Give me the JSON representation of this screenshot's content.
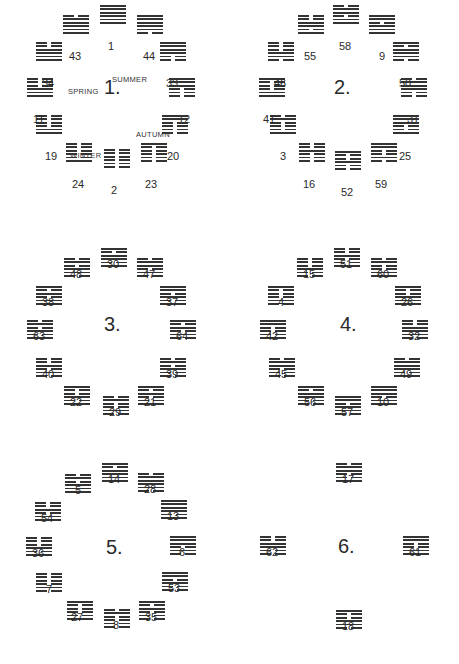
{
  "line_colors": {
    "ink": "#333333",
    "background": "#ffffff"
  },
  "trigram_bits_bottom_to_top": {
    "qian": [
      1,
      1,
      1
    ],
    "dui": [
      1,
      1,
      0
    ],
    "li": [
      1,
      0,
      1
    ],
    "zhen": [
      1,
      0,
      0
    ],
    "xun": [
      0,
      1,
      1
    ],
    "kan": [
      0,
      1,
      0
    ],
    "gen": [
      0,
      0,
      1
    ],
    "kun": [
      0,
      0,
      0
    ]
  },
  "hexagram_trigrams_lower_upper": {
    "1": [
      "qian",
      "qian"
    ],
    "2": [
      "kun",
      "kun"
    ],
    "3": [
      "zhen",
      "kan"
    ],
    "4": [
      "kan",
      "gen"
    ],
    "5": [
      "qian",
      "kan"
    ],
    "6": [
      "kan",
      "qian"
    ],
    "7": [
      "kan",
      "kun"
    ],
    "8": [
      "kun",
      "kan"
    ],
    "9": [
      "qian",
      "xun"
    ],
    "10": [
      "dui",
      "qian"
    ],
    "11": [
      "qian",
      "kun"
    ],
    "12": [
      "kun",
      "qian"
    ],
    "13": [
      "li",
      "qian"
    ],
    "14": [
      "qian",
      "li"
    ],
    "15": [
      "gen",
      "kun"
    ],
    "16": [
      "kun",
      "zhen"
    ],
    "17": [
      "zhen",
      "dui"
    ],
    "18": [
      "xun",
      "gen"
    ],
    "19": [
      "dui",
      "kun"
    ],
    "20": [
      "kun",
      "xun"
    ],
    "21": [
      "zhen",
      "li"
    ],
    "22": [
      "li",
      "gen"
    ],
    "23": [
      "kun",
      "gen"
    ],
    "24": [
      "zhen",
      "kun"
    ],
    "25": [
      "zhen",
      "qian"
    ],
    "26": [
      "qian",
      "gen"
    ],
    "27": [
      "zhen",
      "gen"
    ],
    "28": [
      "xun",
      "dui"
    ],
    "29": [
      "kan",
      "kan"
    ],
    "30": [
      "li",
      "li"
    ],
    "31": [
      "gen",
      "dui"
    ],
    "32": [
      "xun",
      "zhen"
    ],
    "33": [
      "gen",
      "qian"
    ],
    "34": [
      "qian",
      "zhen"
    ],
    "35": [
      "kun",
      "li"
    ],
    "36": [
      "li",
      "kun"
    ],
    "37": [
      "li",
      "xun"
    ],
    "38": [
      "dui",
      "li"
    ],
    "39": [
      "gen",
      "kan"
    ],
    "40": [
      "kan",
      "zhen"
    ],
    "41": [
      "dui",
      "gen"
    ],
    "42": [
      "zhen",
      "xun"
    ],
    "43": [
      "qian",
      "dui"
    ],
    "44": [
      "xun",
      "qian"
    ],
    "45": [
      "kun",
      "dui"
    ],
    "46": [
      "xun",
      "kun"
    ],
    "47": [
      "kan",
      "dui"
    ],
    "48": [
      "xun",
      "kan"
    ],
    "49": [
      "li",
      "dui"
    ],
    "50": [
      "xun",
      "li"
    ],
    "51": [
      "zhen",
      "zhen"
    ],
    "52": [
      "gen",
      "gen"
    ],
    "53": [
      "gen",
      "xun"
    ],
    "54": [
      "dui",
      "zhen"
    ],
    "55": [
      "li",
      "zhen"
    ],
    "56": [
      "gen",
      "li"
    ],
    "57": [
      "xun",
      "xun"
    ],
    "58": [
      "dui",
      "dui"
    ],
    "59": [
      "kan",
      "xun"
    ],
    "60": [
      "dui",
      "kan"
    ],
    "61": [
      "dui",
      "xun"
    ],
    "62": [
      "gen",
      "zhen"
    ],
    "63": [
      "li",
      "kan"
    ],
    "64": [
      "kan",
      "li"
    ]
  },
  "circles": [
    {
      "label": "1.",
      "center": [
        112,
        88
      ],
      "seasons": [
        {
          "text": "SUMMER",
          "x": 112,
          "y": 75
        },
        {
          "text": "SPRING",
          "x": 68,
          "y": 87
        },
        {
          "text": "AUTUMN",
          "x": 136,
          "y": 130
        },
        {
          "text": "WINTER",
          "x": 70,
          "y": 151
        }
      ],
      "hexagrams": [
        {
          "n": 1,
          "x": 100,
          "y": 5,
          "lx": 108,
          "ly": 52
        },
        {
          "n": 44,
          "x": 137,
          "y": 15,
          "lx": 143,
          "ly": 62
        },
        {
          "n": 33,
          "x": 160,
          "y": 42,
          "lx": 166,
          "ly": 89
        },
        {
          "n": 12,
          "x": 169,
          "y": 78,
          "lx": 178,
          "ly": 125
        },
        {
          "n": 20,
          "x": 162,
          "y": 115,
          "lx": 167,
          "ly": 162
        },
        {
          "n": 23,
          "x": 141,
          "y": 143,
          "lx": 145,
          "ly": 190
        },
        {
          "n": 2,
          "x": 104,
          "y": 149,
          "lx": 111,
          "ly": 196
        },
        {
          "n": 24,
          "x": 66,
          "y": 143,
          "lx": 72,
          "ly": 190
        },
        {
          "n": 19,
          "x": 36,
          "y": 115,
          "lx": 45,
          "ly": 162
        },
        {
          "n": 11,
          "x": 27,
          "y": 78,
          "lx": 33,
          "ly": 125
        },
        {
          "n": 34,
          "x": 36,
          "y": 42,
          "lx": 42,
          "ly": 89
        },
        {
          "n": 43,
          "x": 63,
          "y": 15,
          "lx": 69,
          "ly": 62
        }
      ]
    },
    {
      "label": "2.",
      "center": [
        342,
        88
      ],
      "hexagrams": [
        {
          "n": 58,
          "x": 333,
          "y": 5,
          "lx": 339,
          "ly": 52
        },
        {
          "n": 9,
          "x": 369,
          "y": 15,
          "lx": 379,
          "ly": 62
        },
        {
          "n": 50,
          "x": 393,
          "y": 42,
          "lx": 399,
          "ly": 89
        },
        {
          "n": 31,
          "x": 401,
          "y": 78,
          "lx": 407,
          "ly": 125
        },
        {
          "n": 25,
          "x": 393,
          "y": 115,
          "lx": 399,
          "ly": 162
        },
        {
          "n": 59,
          "x": 371,
          "y": 143,
          "lx": 375,
          "ly": 190
        },
        {
          "n": 52,
          "x": 335,
          "y": 151,
          "lx": 341,
          "ly": 198
        },
        {
          "n": 16,
          "x": 299,
          "y": 143,
          "lx": 303,
          "ly": 190
        },
        {
          "n": 3,
          "x": 270,
          "y": 115,
          "lx": 280,
          "ly": 162
        },
        {
          "n": 41,
          "x": 259,
          "y": 78,
          "lx": 263,
          "ly": 125
        },
        {
          "n": 46,
          "x": 268,
          "y": 42,
          "lx": 274,
          "ly": 89
        },
        {
          "n": 55,
          "x": 298,
          "y": 15,
          "lx": 304,
          "ly": 62
        }
      ]
    },
    {
      "label": "3.",
      "center": [
        112,
        325
      ],
      "hexagrams": [
        {
          "n": 30,
          "x": 101,
          "y": 248,
          "lx": 107,
          "ly": 270
        },
        {
          "n": 47,
          "x": 137,
          "y": 258,
          "lx": 143,
          "ly": 280
        },
        {
          "n": 37,
          "x": 160,
          "y": 286,
          "lx": 166,
          "ly": 308
        },
        {
          "n": 64,
          "x": 170,
          "y": 320,
          "lx": 176,
          "ly": 342
        },
        {
          "n": 39,
          "x": 160,
          "y": 358,
          "lx": 166,
          "ly": 380
        },
        {
          "n": 21,
          "x": 138,
          "y": 386,
          "lx": 144,
          "ly": 408
        },
        {
          "n": 29,
          "x": 103,
          "y": 396,
          "lx": 109,
          "ly": 418
        },
        {
          "n": 22,
          "x": 64,
          "y": 386,
          "lx": 70,
          "ly": 408
        },
        {
          "n": 40,
          "x": 36,
          "y": 358,
          "lx": 42,
          "ly": 380
        },
        {
          "n": 63,
          "x": 27,
          "y": 320,
          "lx": 33,
          "ly": 342
        },
        {
          "n": 38,
          "x": 36,
          "y": 286,
          "lx": 42,
          "ly": 308
        },
        {
          "n": 48,
          "x": 64,
          "y": 258,
          "lx": 70,
          "ly": 280
        }
      ]
    },
    {
      "label": "4.",
      "center": [
        348,
        325
      ],
      "hexagrams": [
        {
          "n": 51,
          "x": 334,
          "y": 248,
          "lx": 340,
          "ly": 270
        },
        {
          "n": 60,
          "x": 371,
          "y": 258,
          "lx": 377,
          "ly": 280
        },
        {
          "n": 26,
          "x": 395,
          "y": 286,
          "lx": 401,
          "ly": 308
        },
        {
          "n": 32,
          "x": 402,
          "y": 320,
          "lx": 408,
          "ly": 342
        },
        {
          "n": 49,
          "x": 394,
          "y": 358,
          "lx": 400,
          "ly": 380
        },
        {
          "n": 10,
          "x": 371,
          "y": 386,
          "lx": 377,
          "ly": 408
        },
        {
          "n": 57,
          "x": 335,
          "y": 396,
          "lx": 341,
          "ly": 418
        },
        {
          "n": 56,
          "x": 298,
          "y": 386,
          "lx": 304,
          "ly": 408
        },
        {
          "n": 45,
          "x": 269,
          "y": 358,
          "lx": 275,
          "ly": 380
        },
        {
          "n": 42,
          "x": 260,
          "y": 320,
          "lx": 266,
          "ly": 342
        },
        {
          "n": 4,
          "x": 268,
          "y": 286,
          "lx": 278,
          "ly": 308
        },
        {
          "n": 15,
          "x": 297,
          "y": 258,
          "lx": 303,
          "ly": 280
        }
      ]
    },
    {
      "label": "5.",
      "center": [
        114,
        548
      ],
      "hexagrams": [
        {
          "n": 14,
          "x": 102,
          "y": 463,
          "lx": 108,
          "ly": 485
        },
        {
          "n": 28,
          "x": 138,
          "y": 473,
          "lx": 144,
          "ly": 495
        },
        {
          "n": 13,
          "x": 161,
          "y": 500,
          "lx": 167,
          "ly": 522
        },
        {
          "n": 6,
          "x": 170,
          "y": 536,
          "lx": 179,
          "ly": 558
        },
        {
          "n": 53,
          "x": 162,
          "y": 572,
          "lx": 168,
          "ly": 594
        },
        {
          "n": 35,
          "x": 139,
          "y": 601,
          "lx": 145,
          "ly": 623
        },
        {
          "n": 8,
          "x": 104,
          "y": 609,
          "lx": 113,
          "ly": 631
        },
        {
          "n": 27,
          "x": 67,
          "y": 601,
          "lx": 71,
          "ly": 623
        },
        {
          "n": 7,
          "x": 36,
          "y": 573,
          "lx": 46,
          "ly": 595
        },
        {
          "n": 36,
          "x": 26,
          "y": 537,
          "lx": 32,
          "ly": 559
        },
        {
          "n": 54,
          "x": 35,
          "y": 502,
          "lx": 41,
          "ly": 524
        },
        {
          "n": 5,
          "x": 65,
          "y": 474,
          "lx": 75,
          "ly": 496
        }
      ]
    },
    {
      "label": "6.",
      "center": [
        346,
        547
      ],
      "hexagrams": [
        {
          "n": 17,
          "x": 336,
          "y": 463,
          "lx": 342,
          "ly": 485
        },
        {
          "n": 61,
          "x": 403,
          "y": 536,
          "lx": 409,
          "ly": 558
        },
        {
          "n": 18,
          "x": 336,
          "y": 610,
          "lx": 342,
          "ly": 632
        },
        {
          "n": 62,
          "x": 260,
          "y": 536,
          "lx": 266,
          "ly": 558
        }
      ]
    }
  ]
}
